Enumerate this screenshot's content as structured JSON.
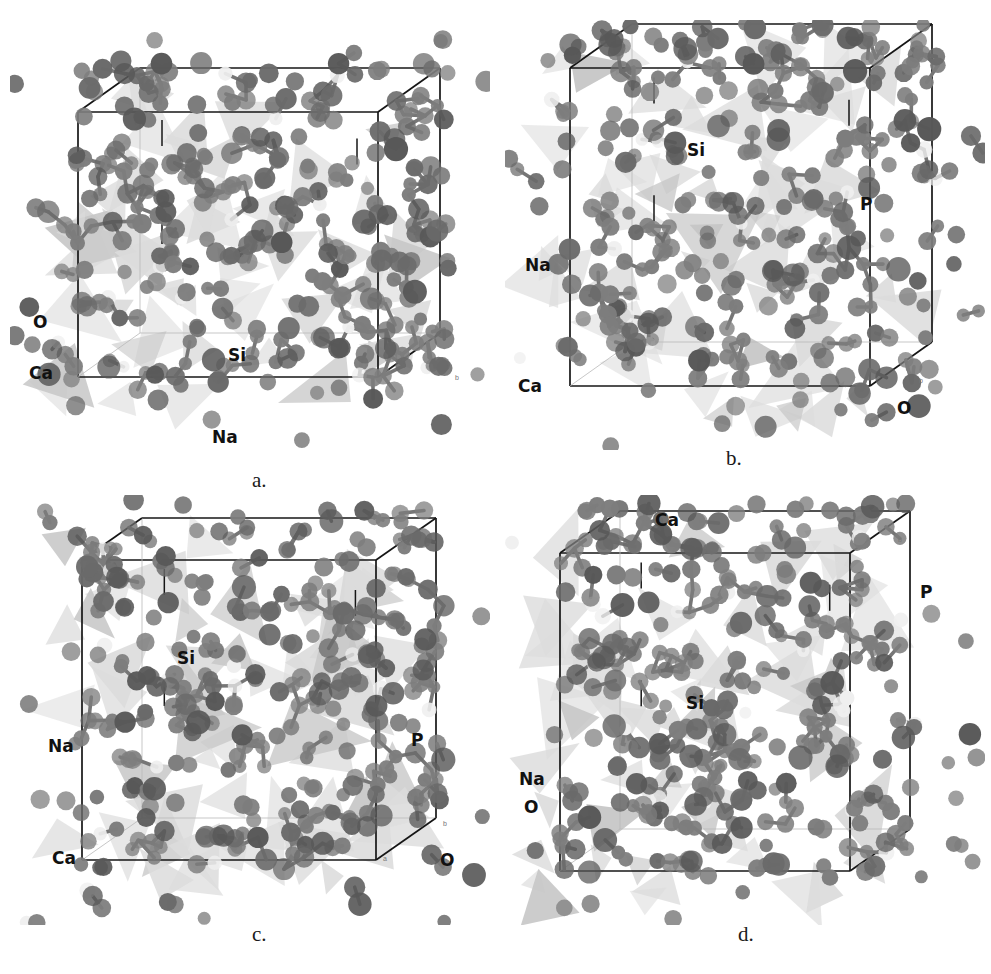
{
  "figure": {
    "kind": "molecular-dynamics-snapshots",
    "background_color": "#ffffff",
    "panel_count": 4
  },
  "palette": {
    "oxygen_color": "#7d7d7d",
    "sodium_color": "#6a6a6a",
    "calcium_color": "#585858",
    "silicon_tetrahedra_color": "#dcdcdc",
    "phosphorus_tetrahedra_color": "#c6c6c6",
    "cell_box_color": "#161616",
    "label_color": "#111111",
    "caption_color": "#1a1a1a"
  },
  "panels": [
    {
      "id": "panel-a",
      "caption": "a.",
      "caption_x": 252,
      "caption_y": 468,
      "box": {
        "x": 10,
        "y": 20,
        "w": 480,
        "h": 430
      },
      "cell": {
        "x": 78,
        "y": 112,
        "w": 300,
        "h": 265,
        "depth_x": 62,
        "depth_y": -44
      },
      "labels": [
        {
          "text": "O",
          "x": 33,
          "y": 312,
          "size": 17
        },
        {
          "text": "Ca",
          "x": 29,
          "y": 363,
          "size": 17
        },
        {
          "text": "Si",
          "x": 228,
          "y": 345,
          "size": 17
        },
        {
          "text": "Na",
          "x": 212,
          "y": 427,
          "size": 17
        }
      ],
      "axis_tags": [
        {
          "text": "b",
          "x": 455,
          "y": 374
        }
      ],
      "seed": 1101,
      "atom_count": 330,
      "poly_count": 52
    },
    {
      "id": "panel-b",
      "caption": "b.",
      "caption_x": 726,
      "caption_y": 446,
      "box": {
        "x": 505,
        "y": 20,
        "w": 480,
        "h": 430
      },
      "cell": {
        "x": 570,
        "y": 68,
        "w": 300,
        "h": 318,
        "depth_x": 62,
        "depth_y": -44
      },
      "labels": [
        {
          "text": "Si",
          "x": 687,
          "y": 140,
          "size": 17
        },
        {
          "text": "P",
          "x": 860,
          "y": 194,
          "size": 17
        },
        {
          "text": "Na",
          "x": 525,
          "y": 255,
          "size": 17
        },
        {
          "text": "Ca",
          "x": 518,
          "y": 376,
          "size": 17
        },
        {
          "text": "O",
          "x": 897,
          "y": 398,
          "size": 17
        }
      ],
      "axis_tags": [
        {
          "text": "b",
          "x": 919,
          "y": 377
        }
      ],
      "seed": 2202,
      "atom_count": 345,
      "poly_count": 56
    },
    {
      "id": "panel-c",
      "caption": "c.",
      "caption_x": 252,
      "caption_y": 922,
      "box": {
        "x": 10,
        "y": 495,
        "w": 480,
        "h": 430
      },
      "cell": {
        "x": 82,
        "y": 560,
        "w": 294,
        "h": 300,
        "depth_x": 60,
        "depth_y": -42
      },
      "labels": [
        {
          "text": "Si",
          "x": 177,
          "y": 648,
          "size": 17
        },
        {
          "text": "Na",
          "x": 48,
          "y": 736,
          "size": 17
        },
        {
          "text": "P",
          "x": 411,
          "y": 730,
          "size": 17
        },
        {
          "text": "Ca",
          "x": 52,
          "y": 848,
          "size": 17
        },
        {
          "text": "O",
          "x": 440,
          "y": 850,
          "size": 17
        }
      ],
      "axis_tags": [
        {
          "text": "a",
          "x": 383,
          "y": 855
        },
        {
          "text": "b",
          "x": 443,
          "y": 820
        }
      ],
      "seed": 3303,
      "atom_count": 335,
      "poly_count": 54
    },
    {
      "id": "panel-d",
      "caption": "d.",
      "caption_x": 738,
      "caption_y": 922,
      "box": {
        "x": 505,
        "y": 495,
        "w": 480,
        "h": 430
      },
      "cell": {
        "x": 560,
        "y": 553,
        "w": 290,
        "h": 318,
        "depth_x": 60,
        "depth_y": -42
      },
      "labels": [
        {
          "text": "Ca",
          "x": 655,
          "y": 510,
          "size": 17
        },
        {
          "text": "P",
          "x": 920,
          "y": 582,
          "size": 17
        },
        {
          "text": "Si",
          "x": 686,
          "y": 693,
          "size": 17
        },
        {
          "text": "Na",
          "x": 519,
          "y": 769,
          "size": 17
        },
        {
          "text": "O",
          "x": 524,
          "y": 797,
          "size": 17
        }
      ],
      "axis_tags": [
        {
          "text": "b",
          "x": 898,
          "y": 536
        }
      ],
      "seed": 4404,
      "atom_count": 340,
      "poly_count": 55
    }
  ]
}
